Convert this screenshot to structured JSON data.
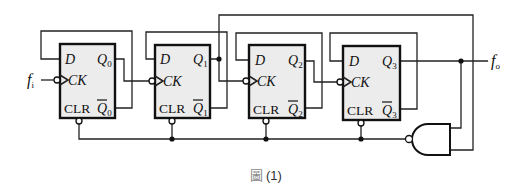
{
  "figure": {
    "caption_glyph": "圖",
    "caption_number": "(1)",
    "input_label": "f",
    "input_sub": "i",
    "output_label": "f",
    "output_sub": "o"
  },
  "flip_flops": [
    {
      "d": "D",
      "ck": "CK",
      "clr": "CLR",
      "q": "Q",
      "q_bar": "Q",
      "index": "0"
    },
    {
      "d": "D",
      "ck": "CK",
      "clr": "CLR",
      "q": "Q",
      "q_bar": "Q",
      "index": "1"
    },
    {
      "d": "D",
      "ck": "CK",
      "clr": "CLR",
      "q": "Q",
      "q_bar": "Q",
      "index": "2"
    },
    {
      "d": "D",
      "ck": "CK",
      "clr": "CLR",
      "q": "Q",
      "q_bar": "Q",
      "index": "3"
    }
  ],
  "gate": {
    "type": "NAND",
    "inputs": [
      "Q1",
      "Q3"
    ],
    "output": "CLR (active-low, to all flip-flops)"
  },
  "colors": {
    "box_fill": "#ececec",
    "line": "#111111",
    "background": "#ffffff"
  }
}
